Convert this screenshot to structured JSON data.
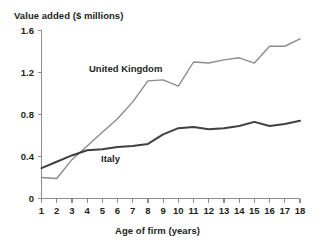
{
  "chart_data": {
    "type": "line",
    "title": "",
    "ylabel": "Value added ($ millions)",
    "xlabel": "Age of firm (years)",
    "x": [
      1,
      2,
      3,
      4,
      5,
      6,
      7,
      8,
      9,
      10,
      11,
      12,
      13,
      14,
      15,
      16,
      17,
      18
    ],
    "xtick_labels": [
      "1",
      "2",
      "3",
      "4",
      "5",
      "6",
      "7",
      "8",
      "9",
      "10",
      "11",
      "12",
      "13",
      "14",
      "15",
      "16",
      "17",
      "18"
    ],
    "ytick_labels": [
      "0",
      "0.4",
      "0.8",
      "1.2",
      "1.6"
    ],
    "ytick_values": [
      0,
      0.4,
      0.8,
      1.2,
      1.6
    ],
    "ylim": [
      0,
      1.6
    ],
    "xlim": [
      1,
      18
    ],
    "grid": false,
    "legend": "inline-labels",
    "series": [
      {
        "name": "United Kingdom",
        "color": "#8c8c8c",
        "width": 1.4,
        "label_x": 7.0,
        "label_y": 1.24,
        "values": [
          0.2,
          0.19,
          0.37,
          0.5,
          0.63,
          0.76,
          0.92,
          1.12,
          1.13,
          1.07,
          1.3,
          1.29,
          1.32,
          1.34,
          1.29,
          1.45,
          1.45,
          1.52
        ]
      },
      {
        "name": "Italy",
        "color": "#404040",
        "width": 2.0,
        "label_x": 5.3,
        "label_y": 0.4,
        "values": [
          0.29,
          0.35,
          0.41,
          0.46,
          0.47,
          0.49,
          0.5,
          0.52,
          0.61,
          0.67,
          0.68,
          0.66,
          0.67,
          0.69,
          0.73,
          0.69,
          0.71,
          0.74
        ]
      }
    ]
  },
  "axes": {
    "axis_color": "#8c8c8c",
    "text_color": "#231f20"
  }
}
